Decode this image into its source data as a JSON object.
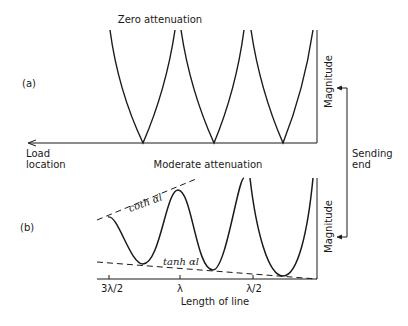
{
  "diagram": {
    "panel_a": {
      "tag": "(a)",
      "title": "Zero attenuation",
      "y_label": "Magnitude",
      "x_arrow_label_line1": "Load",
      "x_arrow_label_line2": "location"
    },
    "panel_b": {
      "tag": "(b)",
      "title": "Moderate attenuation",
      "y_label": "Magnitude",
      "upper_envelope": "coth αl",
      "lower_envelope": "tanh αl",
      "x_ticks": [
        "3λ/2",
        "λ",
        "λ/2"
      ],
      "x_label": "Length of line"
    },
    "sending_end_line1": "Sending",
    "sending_end_line2": "end"
  }
}
